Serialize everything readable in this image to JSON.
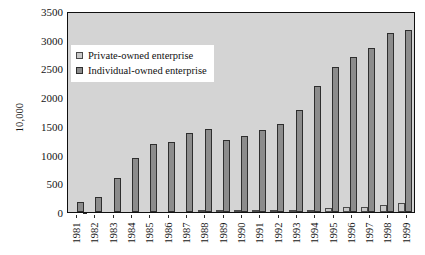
{
  "chart_data": {
    "type": "bar",
    "title": "",
    "xlabel": "",
    "ylabel": "10,000",
    "ylim": [
      0,
      3500
    ],
    "yticks": [
      0,
      500,
      1000,
      1500,
      2000,
      2500,
      3000,
      3500
    ],
    "ytick_labels": [
      "0",
      "500",
      "1000",
      "1500",
      "2000",
      "2500",
      "3000",
      "3500"
    ],
    "grid": false,
    "legend_position": "upper-left-inside",
    "categories": [
      "1981",
      "1982",
      "1983",
      "1984",
      "1985",
      "1986",
      "1987",
      "1988",
      "1989",
      "1990",
      "1991",
      "1992",
      "1993",
      "1994",
      "1995",
      "1996",
      "1997",
      "1998",
      "1999"
    ],
    "series": [
      {
        "name": "Private-owned enterprise",
        "color": "#c8c8c8",
        "values": [
          0,
          0,
          0,
          0,
          0,
          0,
          0,
          3,
          9,
          14,
          11,
          12,
          24,
          43,
          65,
          82,
          96,
          121,
          151
        ]
      },
      {
        "name": "Individual-owned enterprise",
        "color": "#8c8c8c",
        "values": [
          183,
          270,
          600,
          940,
          1180,
          1215,
          1375,
          1450,
          1250,
          1330,
          1420,
          1535,
          1780,
          2200,
          2530,
          2705,
          2860,
          3120,
          3170
        ]
      }
    ]
  },
  "legend": {
    "items": [
      {
        "label": "Private-owned enterprise",
        "swatch": "private"
      },
      {
        "label": "Individual-owned enterprise",
        "swatch": "individual"
      }
    ]
  }
}
